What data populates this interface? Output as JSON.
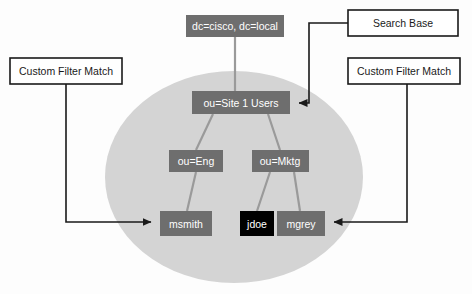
{
  "diagram": {
    "colors": {
      "page_background": "#fdfdfd",
      "ellipse_fill": "#d4d4d4",
      "node_fill": "#6e6e6e",
      "node_highlight_fill": "#000000",
      "node_text": "#ffffff",
      "callout_fill": "#ffffff",
      "callout_border": "#1a1a1a",
      "callout_text": "#1a1a1a",
      "connector": "#9a9a9a",
      "annotation_line": "#1a1a1a"
    },
    "scope_region": {
      "name": "search-scope-ellipse",
      "shape": "ellipse",
      "cx": 234,
      "cy": 177,
      "rx": 129,
      "ry": 106
    },
    "nodes": [
      {
        "id": "root",
        "label": "dc=cisco, dc=local",
        "x": 186,
        "y": 15,
        "width": 98,
        "height": 22,
        "style": "normal"
      },
      {
        "id": "site1",
        "label": "ou=Site 1 Users",
        "x": 192,
        "y": 91,
        "width": 98,
        "height": 23,
        "style": "normal"
      },
      {
        "id": "eng",
        "label": "ou=Eng",
        "x": 169,
        "y": 150,
        "width": 54,
        "height": 22,
        "style": "normal"
      },
      {
        "id": "mktg",
        "label": "ou=Mktg",
        "x": 252,
        "y": 150,
        "width": 57,
        "height": 22,
        "style": "normal"
      },
      {
        "id": "msmith",
        "label": "msmith",
        "x": 160,
        "y": 211,
        "width": 52,
        "height": 25,
        "style": "normal"
      },
      {
        "id": "jdoe",
        "label": "jdoe",
        "x": 240,
        "y": 211,
        "width": 34,
        "height": 25,
        "style": "highlight"
      },
      {
        "id": "mgrey",
        "label": "mgrey",
        "x": 277,
        "y": 211,
        "width": 48,
        "height": 25,
        "style": "normal"
      }
    ],
    "callouts": [
      {
        "id": "search-base",
        "label": "Search Base",
        "x": 348,
        "y": 10,
        "width": 110,
        "height": 26,
        "target": "ou=Site 1 Users"
      },
      {
        "id": "custom-filter-match-left",
        "label": "Custom Filter Match",
        "x": 10,
        "y": 58,
        "width": 112,
        "height": 26,
        "target": "msmith"
      },
      {
        "id": "custom-filter-match-right",
        "label": "Custom Filter Match",
        "x": 348,
        "y": 58,
        "width": 112,
        "height": 26,
        "target": "mgrey"
      }
    ],
    "tree_edges": [
      {
        "from": "root",
        "to": "site1"
      },
      {
        "from": "site1",
        "to": "eng"
      },
      {
        "from": "site1",
        "to": "mktg"
      },
      {
        "from": "eng",
        "to": "msmith"
      },
      {
        "from": "mktg",
        "to": "jdoe"
      },
      {
        "from": "mktg",
        "to": "mgrey"
      }
    ]
  }
}
